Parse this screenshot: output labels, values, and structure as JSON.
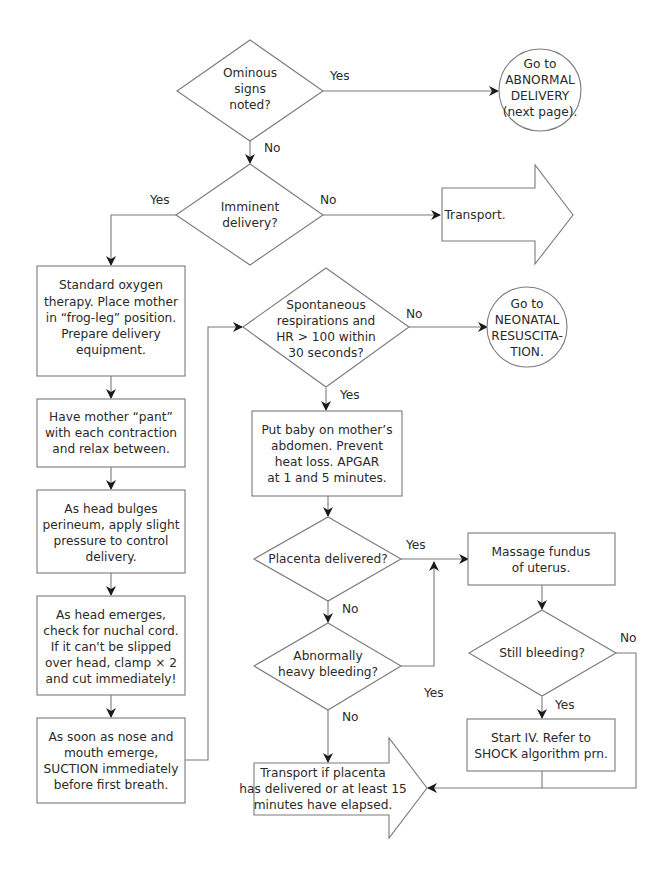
{
  "diagram": {
    "type": "flowchart",
    "colors": {
      "stroke": "#7a7a7a",
      "arrow": "#1a1a1a",
      "text": "#2a2a2a",
      "background": "#ffffff"
    },
    "nodes": {
      "ominous": {
        "shape": "diamond",
        "lines": [
          "Ominous",
          "signs",
          "noted?"
        ]
      },
      "abnormal": {
        "shape": "circle",
        "lines": [
          "Go to",
          "ABNORMAL",
          "DELIVERY",
          "(next page)."
        ]
      },
      "imminent": {
        "shape": "diamond",
        "lines": [
          "Imminent",
          "delivery?"
        ]
      },
      "transport1": {
        "shape": "arrow",
        "lines": [
          "Transport."
        ]
      },
      "oxygen": {
        "shape": "box",
        "lines": [
          "Standard oxygen",
          "therapy. Place mother",
          "in “frog-leg” position.",
          "Prepare delivery",
          "equipment."
        ]
      },
      "pant": {
        "shape": "box",
        "lines": [
          "Have mother “pant”",
          "with each contraction",
          "and relax between."
        ]
      },
      "bulges": {
        "shape": "box",
        "lines": [
          "As head bulges",
          "perineum, apply slight",
          "pressure to control",
          "delivery."
        ]
      },
      "nuchal": {
        "shape": "box",
        "lines": [
          "As head emerges,",
          "check for nuchal cord.",
          "If it can't be slipped",
          "over head, clamp × 2",
          "and cut immediately!"
        ]
      },
      "suction": {
        "shape": "box",
        "lines": [
          "As soon as nose and",
          "mouth emerge,",
          "SUCTION immediately",
          "before first breath."
        ]
      },
      "spont": {
        "shape": "diamond",
        "lines": [
          "Spontaneous",
          "respirations and",
          "HR > 100 within",
          "30 seconds?"
        ]
      },
      "neonatal": {
        "shape": "circle",
        "lines": [
          "Go to",
          "NEONATAL",
          "RESUSCITA-",
          "TION."
        ]
      },
      "baby": {
        "shape": "box",
        "lines": [
          "Put baby on mother’s",
          "abdomen. Prevent",
          "heat loss. APGAR",
          "at 1 and 5 minutes."
        ]
      },
      "placenta": {
        "shape": "diamond",
        "lines": [
          "Placenta delivered?"
        ]
      },
      "heavy": {
        "shape": "diamond",
        "lines": [
          "Abnormally",
          "heavy bleeding?"
        ]
      },
      "massage": {
        "shape": "box",
        "lines": [
          "Massage fundus",
          "of uterus."
        ]
      },
      "still": {
        "shape": "diamond",
        "lines": [
          "Still bleeding?"
        ]
      },
      "iv": {
        "shape": "box",
        "lines": [
          "Start IV. Refer to",
          "SHOCK algorithm prn."
        ]
      },
      "transport2": {
        "shape": "arrow",
        "lines": [
          "Transport if placenta",
          "has delivered or at least 15",
          "minutes have elapsed."
        ]
      }
    },
    "edge_labels": {
      "ominous_yes": "Yes",
      "ominous_no": "No",
      "imminent_yes": "Yes",
      "imminent_no": "No",
      "spont_no": "No",
      "spont_yes": "Yes",
      "placenta_yes": "Yes",
      "placenta_no": "No",
      "heavy_yes": "Yes",
      "heavy_no": "No",
      "still_no": "No",
      "still_yes": "Yes"
    },
    "edges": [
      {
        "from": "ominous",
        "to": "abnormal",
        "label": "Yes"
      },
      {
        "from": "ominous",
        "to": "imminent",
        "label": "No"
      },
      {
        "from": "imminent",
        "to": "oxygen",
        "label": "Yes"
      },
      {
        "from": "imminent",
        "to": "transport1",
        "label": "No"
      },
      {
        "from": "oxygen",
        "to": "pant"
      },
      {
        "from": "pant",
        "to": "bulges"
      },
      {
        "from": "bulges",
        "to": "nuchal"
      },
      {
        "from": "nuchal",
        "to": "suction"
      },
      {
        "from": "suction",
        "to": "spont"
      },
      {
        "from": "spont",
        "to": "neonatal",
        "label": "No"
      },
      {
        "from": "spont",
        "to": "baby",
        "label": "Yes"
      },
      {
        "from": "baby",
        "to": "placenta"
      },
      {
        "from": "placenta",
        "to": "massage",
        "label": "Yes"
      },
      {
        "from": "placenta",
        "to": "heavy",
        "label": "No"
      },
      {
        "from": "heavy",
        "to": "massage",
        "label": "Yes"
      },
      {
        "from": "heavy",
        "to": "transport2",
        "label": "No"
      },
      {
        "from": "massage",
        "to": "still"
      },
      {
        "from": "still",
        "to": "iv",
        "label": "Yes"
      },
      {
        "from": "still",
        "to": "transport2",
        "label": "No"
      },
      {
        "from": "iv",
        "to": "transport2"
      }
    ]
  }
}
